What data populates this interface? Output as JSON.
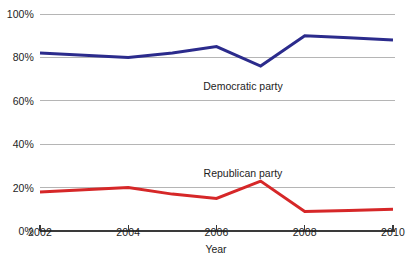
{
  "chart_data": {
    "type": "line",
    "title": "",
    "subtitle": "",
    "xlabel": "Year",
    "ylabel": "",
    "x": [
      2002,
      2003,
      2004,
      2005,
      2006,
      2007,
      2008,
      2009,
      2010
    ],
    "xlim": [
      2002,
      2010
    ],
    "ylim": [
      0,
      100
    ],
    "y_tick_values": [
      0,
      20,
      40,
      60,
      80,
      100
    ],
    "y_tick_labels": [
      "0%",
      "20%",
      "40%",
      "60%",
      "80%",
      "100%"
    ],
    "x_tick_values": [
      2002,
      2004,
      2006,
      2008,
      2010
    ],
    "x_tick_labels": [
      "2002",
      "2004",
      "2006",
      "2008",
      "2010"
    ],
    "grid": "horizontal",
    "legend_position": "inline-annotations",
    "value_suffix": "%",
    "series": [
      {
        "name": "Democratic party",
        "color": "#2b2b8c",
        "values": [
          82,
          81,
          80,
          82,
          85,
          76,
          90,
          89,
          88
        ],
        "label_x": 2006.6,
        "label_y": 69
      },
      {
        "name": "Republican party",
        "color": "#d62728",
        "values": [
          18,
          19,
          20,
          17,
          15,
          23,
          9,
          9.5,
          10
        ],
        "label_x": 2006.6,
        "label_y": 29
      }
    ]
  },
  "axes": {
    "x_axis_label": "Year",
    "y_ticks": [
      {
        "label": "100%",
        "value": 100
      },
      {
        "label": "80%",
        "value": 80
      },
      {
        "label": "60%",
        "value": 60
      },
      {
        "label": "40%",
        "value": 40
      },
      {
        "label": "20%",
        "value": 20
      },
      {
        "label": "0%",
        "value": 0
      }
    ],
    "x_ticks": [
      {
        "label": "2002",
        "value": 2002
      },
      {
        "label": "2004",
        "value": 2004
      },
      {
        "label": "2006",
        "value": 2006
      },
      {
        "label": "2008",
        "value": 2008
      },
      {
        "label": "2010",
        "value": 2010
      }
    ]
  },
  "annotations": [
    {
      "text": "Democratic party"
    },
    {
      "text": "Republican party"
    }
  ],
  "colors": {
    "democratic": "#2b2b8c",
    "republican": "#d62728",
    "gridline": "#b5b5b5",
    "axis": "#3a3a3a",
    "text": "#1d1d1d",
    "background": "#ffffff"
  }
}
